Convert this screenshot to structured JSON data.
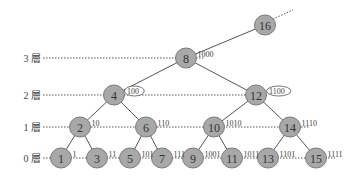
{
  "diagram": {
    "type": "binary-indexed-tree",
    "levels": [
      {
        "id": 3,
        "label": "3 層"
      },
      {
        "id": 2,
        "label": "2 層"
      },
      {
        "id": 1,
        "label": "1 層"
      },
      {
        "id": 0,
        "label": "0 層"
      }
    ],
    "nodes": [
      {
        "id": "16",
        "label": "16",
        "binary": "",
        "level": 4
      },
      {
        "id": "8",
        "label": "8",
        "binary": "1000",
        "level": 3
      },
      {
        "id": "4",
        "label": "4",
        "binary": "100",
        "level": 2,
        "callout": true
      },
      {
        "id": "12",
        "label": "12",
        "binary": "1100",
        "level": 2,
        "callout": true
      },
      {
        "id": "2",
        "label": "2",
        "binary": "10",
        "level": 1
      },
      {
        "id": "6",
        "label": "6",
        "binary": "110",
        "level": 1
      },
      {
        "id": "10",
        "label": "10",
        "binary": "1010",
        "level": 1
      },
      {
        "id": "14",
        "label": "14",
        "binary": "1110",
        "level": 1
      },
      {
        "id": "1",
        "label": "1",
        "binary": "1",
        "level": 0
      },
      {
        "id": "3",
        "label": "3",
        "binary": "11",
        "level": 0
      },
      {
        "id": "5",
        "label": "5",
        "binary": "101",
        "level": 0
      },
      {
        "id": "7",
        "label": "7",
        "binary": "111",
        "level": 0
      },
      {
        "id": "9",
        "label": "9",
        "binary": "1001",
        "level": 0
      },
      {
        "id": "11",
        "label": "11",
        "binary": "1011",
        "level": 0
      },
      {
        "id": "13",
        "label": "13",
        "binary": "1101",
        "level": 0
      },
      {
        "id": "15",
        "label": "15",
        "binary": "1111",
        "level": 0
      }
    ],
    "edges": [
      [
        "16",
        "8"
      ],
      [
        "8",
        "4"
      ],
      [
        "8",
        "12"
      ],
      [
        "4",
        "2"
      ],
      [
        "4",
        "6"
      ],
      [
        "12",
        "10"
      ],
      [
        "12",
        "14"
      ],
      [
        "2",
        "1"
      ],
      [
        "2",
        "3"
      ],
      [
        "6",
        "5"
      ],
      [
        "6",
        "7"
      ],
      [
        "10",
        "9"
      ],
      [
        "10",
        "11"
      ],
      [
        "14",
        "13"
      ],
      [
        "14",
        "15"
      ]
    ],
    "continuation_from": "16"
  }
}
